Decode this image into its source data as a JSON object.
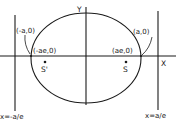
{
  "diagram": {
    "axes": {
      "x_label": "X",
      "y_label": "Y"
    },
    "points": {
      "left_vertex": "(-a,0)",
      "right_vertex": "(a,0)",
      "left_focus_coord": "(-ae,0)",
      "right_focus_coord": "(ae,0)",
      "left_focus_name": "S'",
      "right_focus_name": "S"
    },
    "directrices": {
      "left": "x=-a/e",
      "right": "x=a/e"
    },
    "colors": {
      "ink": "#1a1a1a",
      "background": "#ffffff"
    }
  }
}
